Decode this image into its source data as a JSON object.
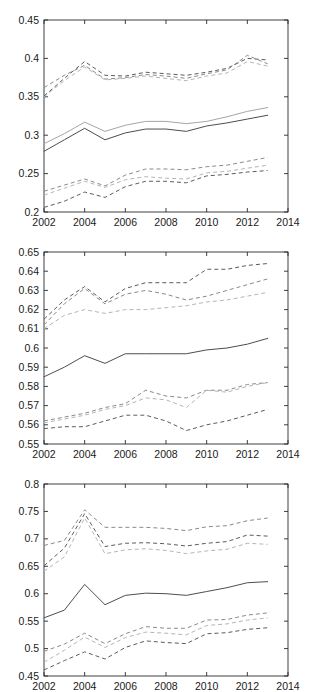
{
  "figure": {
    "width": 313,
    "height": 692,
    "background": "#ffffff",
    "panel_count": 3
  },
  "chart_data": [
    {
      "type": "line",
      "title": "",
      "xlabel": "",
      "ylabel": "",
      "xlim": [
        2002,
        2014
      ],
      "ylim": [
        0.2,
        0.45
      ],
      "xticks": [
        2002,
        2004,
        2006,
        2008,
        2010,
        2012,
        2014
      ],
      "xtick_labels": [
        "2002",
        "2004",
        "2006",
        "2008",
        "2010",
        "2012",
        "2014"
      ],
      "yticks": [
        0.2,
        0.25,
        0.3,
        0.35,
        0.4,
        0.45
      ],
      "ytick_labels": [
        "0.2",
        "0.25",
        "0.3",
        "0.35",
        "0.4",
        "0.45"
      ],
      "grid": false,
      "legend": "none",
      "x": [
        2002,
        2003,
        2004,
        2005,
        2006,
        2007,
        2008,
        2009,
        2010,
        2011,
        2012,
        2013
      ],
      "series": [
        {
          "name": "upper-band-a",
          "style": "dashed",
          "color": "#5c5c5c",
          "values": [
            0.351,
            0.374,
            0.396,
            0.378,
            0.377,
            0.382,
            0.38,
            0.378,
            0.382,
            0.387,
            0.4,
            0.398
          ]
        },
        {
          "name": "upper-band-b",
          "style": "dashed",
          "color": "#8a8a8a",
          "values": [
            0.362,
            0.378,
            0.391,
            0.373,
            0.375,
            0.379,
            0.377,
            0.374,
            0.38,
            0.385,
            0.404,
            0.393
          ]
        },
        {
          "name": "upper-band-c",
          "style": "dashed",
          "color": "#b5b5b5",
          "values": [
            0.35,
            0.371,
            0.389,
            0.372,
            0.374,
            0.377,
            0.374,
            0.371,
            0.377,
            0.381,
            0.396,
            0.39
          ]
        },
        {
          "name": "center-line-light",
          "style": "solid",
          "color": "#a6a6a6",
          "values": [
            0.289,
            0.302,
            0.317,
            0.305,
            0.313,
            0.318,
            0.318,
            0.315,
            0.318,
            0.324,
            0.331,
            0.336
          ]
        },
        {
          "name": "center-line-dark",
          "style": "solid",
          "color": "#4d4d4d",
          "values": [
            0.279,
            0.294,
            0.309,
            0.294,
            0.303,
            0.308,
            0.308,
            0.305,
            0.312,
            0.316,
            0.321,
            0.326
          ]
        },
        {
          "name": "lower-band-a",
          "style": "dashed",
          "color": "#8a8a8a",
          "values": [
            0.227,
            0.235,
            0.243,
            0.234,
            0.248,
            0.256,
            0.256,
            0.255,
            0.259,
            0.261,
            0.266,
            0.271
          ]
        },
        {
          "name": "lower-band-b",
          "style": "dashed",
          "color": "#b5b5b5",
          "values": [
            0.222,
            0.231,
            0.24,
            0.232,
            0.242,
            0.246,
            0.244,
            0.243,
            0.251,
            0.253,
            0.257,
            0.261
          ]
        },
        {
          "name": "lower-band-c",
          "style": "dashed",
          "color": "#5c5c5c",
          "values": [
            0.206,
            0.214,
            0.226,
            0.219,
            0.233,
            0.24,
            0.24,
            0.238,
            0.247,
            0.249,
            0.252,
            0.254
          ]
        }
      ]
    },
    {
      "type": "line",
      "title": "",
      "xlabel": "",
      "ylabel": "",
      "xlim": [
        2002,
        2014
      ],
      "ylim": [
        0.55,
        0.65
      ],
      "xticks": [
        2002,
        2004,
        2006,
        2008,
        2010,
        2012,
        2014
      ],
      "xtick_labels": [
        "2002",
        "2004",
        "2006",
        "2008",
        "2010",
        "2012",
        "2014"
      ],
      "yticks": [
        0.55,
        0.56,
        0.57,
        0.58,
        0.59,
        0.6,
        0.61,
        0.62,
        0.63,
        0.64,
        0.65
      ],
      "ytick_labels": [
        "0.55",
        "0.56",
        "0.57",
        "0.58",
        "0.59",
        "0.6",
        "0.61",
        "0.62",
        "0.63",
        "0.64",
        "0.65"
      ],
      "grid": false,
      "legend": "none",
      "x": [
        2002,
        2003,
        2004,
        2005,
        2006,
        2007,
        2008,
        2009,
        2010,
        2011,
        2012,
        2013
      ],
      "series": [
        {
          "name": "upper-band-a",
          "style": "dashed",
          "color": "#5c5c5c",
          "values": [
            0.615,
            0.625,
            0.632,
            0.624,
            0.631,
            0.634,
            0.634,
            0.634,
            0.641,
            0.641,
            0.643,
            0.644
          ]
        },
        {
          "name": "upper-band-b",
          "style": "dashed",
          "color": "#8a8a8a",
          "values": [
            0.612,
            0.623,
            0.631,
            0.623,
            0.628,
            0.63,
            0.628,
            0.625,
            0.627,
            0.63,
            0.633,
            0.636
          ]
        },
        {
          "name": "upper-band-c",
          "style": "dashed",
          "color": "#b5b5b5",
          "values": [
            0.61,
            0.617,
            0.62,
            0.618,
            0.62,
            0.62,
            0.621,
            0.622,
            0.624,
            0.625,
            0.627,
            0.629
          ]
        },
        {
          "name": "center-line",
          "style": "solid",
          "color": "#4d4d4d",
          "values": [
            0.585,
            0.59,
            0.596,
            0.592,
            0.597,
            0.597,
            0.597,
            0.597,
            0.599,
            0.6,
            0.602,
            0.605
          ]
        },
        {
          "name": "lower-band-a",
          "style": "dashed",
          "color": "#8a8a8a",
          "values": [
            0.562,
            0.564,
            0.566,
            0.569,
            0.571,
            0.578,
            0.575,
            0.574,
            0.578,
            0.578,
            0.581,
            0.582
          ]
        },
        {
          "name": "lower-band-b",
          "style": "dashed",
          "color": "#b5b5b5",
          "values": [
            0.561,
            0.563,
            0.565,
            0.568,
            0.57,
            0.574,
            0.573,
            0.569,
            0.578,
            0.577,
            0.58,
            0.582
          ]
        },
        {
          "name": "lower-band-c",
          "style": "dashed",
          "color": "#5c5c5c",
          "values": [
            0.558,
            0.559,
            0.559,
            0.562,
            0.565,
            0.565,
            0.562,
            0.557,
            0.56,
            0.562,
            0.565,
            0.568
          ]
        }
      ]
    },
    {
      "type": "line",
      "title": "",
      "xlabel": "",
      "ylabel": "",
      "xlim": [
        2002,
        2014
      ],
      "ylim": [
        0.45,
        0.8
      ],
      "xticks": [
        2002,
        2004,
        2006,
        2008,
        2010,
        2012,
        2014
      ],
      "xtick_labels": [
        "2002",
        "2004",
        "2006",
        "2008",
        "2010",
        "2012",
        "2014"
      ],
      "yticks": [
        0.45,
        0.5,
        0.55,
        0.6,
        0.65,
        0.7,
        0.75,
        0.8
      ],
      "ytick_labels": [
        "0.45",
        "0.5",
        "0.55",
        "0.6",
        "0.65",
        "0.7",
        "0.75",
        "0.8"
      ],
      "grid": false,
      "legend": "none",
      "x": [
        2002,
        2003,
        2004,
        2005,
        2006,
        2007,
        2008,
        2009,
        2010,
        2011,
        2012,
        2013
      ],
      "series": [
        {
          "name": "upper-band-a",
          "style": "dashed",
          "color": "#8a8a8a",
          "values": [
            0.688,
            0.697,
            0.753,
            0.721,
            0.721,
            0.721,
            0.719,
            0.715,
            0.722,
            0.724,
            0.733,
            0.738
          ]
        },
        {
          "name": "upper-band-b",
          "style": "dashed",
          "color": "#5c5c5c",
          "values": [
            0.651,
            0.683,
            0.746,
            0.686,
            0.692,
            0.693,
            0.691,
            0.687,
            0.692,
            0.695,
            0.707,
            0.705
          ]
        },
        {
          "name": "upper-band-c",
          "style": "dashed",
          "color": "#b5b5b5",
          "values": [
            0.641,
            0.667,
            0.738,
            0.673,
            0.68,
            0.682,
            0.679,
            0.673,
            0.678,
            0.681,
            0.692,
            0.69
          ]
        },
        {
          "name": "center-line",
          "style": "solid",
          "color": "#4d4d4d",
          "values": [
            0.556,
            0.57,
            0.617,
            0.58,
            0.597,
            0.601,
            0.6,
            0.597,
            0.604,
            0.611,
            0.62,
            0.622
          ]
        },
        {
          "name": "lower-band-a",
          "style": "dashed",
          "color": "#8a8a8a",
          "values": [
            0.495,
            0.508,
            0.528,
            0.509,
            0.527,
            0.54,
            0.537,
            0.537,
            0.552,
            0.553,
            0.561,
            0.565
          ]
        },
        {
          "name": "lower-band-b",
          "style": "dashed",
          "color": "#b5b5b5",
          "values": [
            0.475,
            0.497,
            0.521,
            0.502,
            0.52,
            0.53,
            0.528,
            0.525,
            0.542,
            0.545,
            0.552,
            0.556
          ]
        },
        {
          "name": "lower-band-c",
          "style": "dashed",
          "color": "#5c5c5c",
          "values": [
            0.461,
            0.478,
            0.494,
            0.481,
            0.502,
            0.514,
            0.511,
            0.509,
            0.527,
            0.529,
            0.535,
            0.538
          ]
        }
      ]
    }
  ]
}
